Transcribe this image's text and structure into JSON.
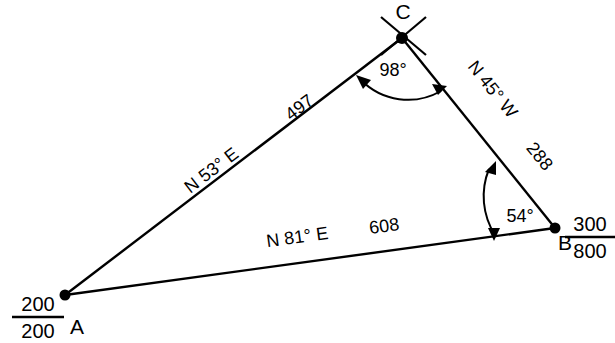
{
  "diagram": {
    "background_color": "#ffffff",
    "line_color": "#000000",
    "vertices": [
      {
        "id": "A",
        "label": "A",
        "x": 65,
        "y": 295,
        "coordinate_numerator": "200",
        "coordinate_denominator": "200",
        "marker": "dot"
      },
      {
        "id": "B",
        "label": "B",
        "x": 555,
        "y": 228,
        "coordinate_numerator": "300",
        "coordinate_denominator": "800",
        "marker": "dot"
      },
      {
        "id": "C",
        "label": "C",
        "x": 402,
        "y": 38,
        "coordinate_numerator": null,
        "coordinate_denominator": null,
        "marker": "dot-with-cross-ticks"
      }
    ],
    "sides": [
      {
        "id": "AC",
        "from": "A",
        "to": "C",
        "bearing": "N 53° E",
        "distance": "497"
      },
      {
        "id": "CB",
        "from": "C",
        "to": "B",
        "bearing": "N 45° W",
        "distance": "288"
      },
      {
        "id": "AB",
        "from": "A",
        "to": "B",
        "bearing": "N 81° E",
        "distance": "608"
      }
    ],
    "angles": [
      {
        "id": "angle-C",
        "at_vertex": "C",
        "label": "98°",
        "arc_style": "double-arrow"
      },
      {
        "id": "angle-B",
        "at_vertex": "B",
        "label": "54°",
        "arc_style": "double-arrow"
      }
    ]
  }
}
